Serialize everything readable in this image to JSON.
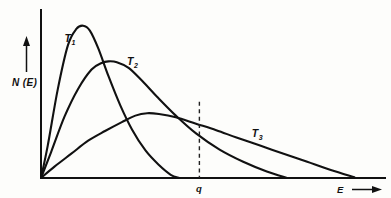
{
  "figure": {
    "background_color": "#fdfdfb",
    "line_color": "#111111",
    "y_axis_label": "N (E)",
    "x_axis_label": "E",
    "marker_label": "q"
  },
  "labels": {
    "t1_base": "T",
    "t1_sub": "1",
    "t2_base": "T",
    "t2_sub": "2",
    "t3_base": "T",
    "t3_sub": "3",
    "y_axis": "N (E)",
    "x_axis": "E",
    "q_marker": "q"
  },
  "chart_data": {
    "type": "line",
    "title": "",
    "subtitle": "",
    "xlabel": "E",
    "ylabel": "N (E)",
    "xlim": [
      0,
      1
    ],
    "ylim": [
      0,
      1
    ],
    "grid": false,
    "legend": "inline-curve-labels",
    "axis_arrows": {
      "x": "right",
      "y": "up"
    },
    "annotations": [
      {
        "name": "q-threshold",
        "label": "q",
        "type": "vertical-dashed-line",
        "x": 0.47,
        "y_top": 0.47,
        "y_bottom": 0.0
      }
    ],
    "series": [
      {
        "name": "T1",
        "label": "T₁",
        "description": "lowest temperature: tall narrow peak at low energy",
        "peak_x": 0.125,
        "peak_y": 0.94,
        "x_end": 0.41,
        "label_x": 0.07,
        "label_y": 0.84,
        "x": [
          0.0,
          0.02,
          0.05,
          0.08,
          0.105,
          0.125,
          0.145,
          0.17,
          0.2,
          0.235,
          0.27,
          0.31,
          0.35,
          0.385,
          0.41
        ],
        "y": [
          0.0,
          0.2,
          0.55,
          0.82,
          0.92,
          0.94,
          0.91,
          0.8,
          0.63,
          0.45,
          0.3,
          0.17,
          0.08,
          0.02,
          0.0
        ]
      },
      {
        "name": "T2",
        "label": "T₂",
        "description": "intermediate temperature: medium peak, broader tail",
        "peak_x": 0.2,
        "peak_y": 0.72,
        "x_end": 0.73,
        "label_x": 0.255,
        "label_y": 0.7,
        "x": [
          0.0,
          0.03,
          0.07,
          0.11,
          0.15,
          0.18,
          0.2,
          0.225,
          0.26,
          0.3,
          0.345,
          0.4,
          0.46,
          0.53,
          0.6,
          0.67,
          0.73
        ],
        "y": [
          0.0,
          0.16,
          0.38,
          0.55,
          0.67,
          0.71,
          0.72,
          0.715,
          0.68,
          0.6,
          0.5,
          0.385,
          0.275,
          0.175,
          0.1,
          0.04,
          0.0
        ]
      },
      {
        "name": "T3",
        "label": "T₃",
        "description": "highest temperature: broad low peak, long tail",
        "peak_x": 0.315,
        "peak_y": 0.4,
        "x_end": 0.93,
        "label_x": 0.625,
        "label_y": 0.255,
        "x": [
          0.0,
          0.04,
          0.09,
          0.14,
          0.19,
          0.24,
          0.28,
          0.315,
          0.35,
          0.4,
          0.46,
          0.52,
          0.58,
          0.65,
          0.72,
          0.79,
          0.86,
          0.93
        ],
        "y": [
          0.0,
          0.07,
          0.15,
          0.23,
          0.29,
          0.345,
          0.385,
          0.4,
          0.395,
          0.375,
          0.335,
          0.295,
          0.25,
          0.2,
          0.15,
          0.1,
          0.05,
          0.005
        ]
      }
    ]
  }
}
